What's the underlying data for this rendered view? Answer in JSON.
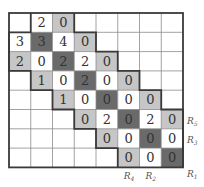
{
  "figure": {
    "rows": 8,
    "cols": 8,
    "colors": {
      "white": "#ffffff",
      "light": "#c6c6c6",
      "dark": "#6a6a6a",
      "grid_line": "#8a8a8a",
      "thick_line": "#3a3a3a",
      "text": "#333333"
    },
    "cells": [
      {
        "r": 0,
        "c": 1,
        "v": "2",
        "shade": "white"
      },
      {
        "r": 0,
        "c": 2,
        "v": "0",
        "shade": "light"
      },
      {
        "r": 1,
        "c": 0,
        "v": "3",
        "shade": "white"
      },
      {
        "r": 1,
        "c": 1,
        "v": "3",
        "shade": "dark"
      },
      {
        "r": 1,
        "c": 2,
        "v": "4",
        "shade": "white"
      },
      {
        "r": 1,
        "c": 3,
        "v": "0",
        "shade": "light"
      },
      {
        "r": 2,
        "c": 0,
        "v": "2",
        "shade": "light"
      },
      {
        "r": 2,
        "c": 1,
        "v": "0",
        "shade": "white"
      },
      {
        "r": 2,
        "c": 2,
        "v": "2",
        "shade": "dark"
      },
      {
        "r": 2,
        "c": 3,
        "v": "2",
        "shade": "white"
      },
      {
        "r": 2,
        "c": 4,
        "v": "0",
        "shade": "light"
      },
      {
        "r": 3,
        "c": 1,
        "v": "1",
        "shade": "light"
      },
      {
        "r": 3,
        "c": 2,
        "v": "0",
        "shade": "white"
      },
      {
        "r": 3,
        "c": 3,
        "v": "2",
        "shade": "dark"
      },
      {
        "r": 3,
        "c": 4,
        "v": "0",
        "shade": "white"
      },
      {
        "r": 3,
        "c": 5,
        "v": "0",
        "shade": "light"
      },
      {
        "r": 4,
        "c": 2,
        "v": "1",
        "shade": "light"
      },
      {
        "r": 4,
        "c": 3,
        "v": "0",
        "shade": "white"
      },
      {
        "r": 4,
        "c": 4,
        "v": "0",
        "shade": "dark"
      },
      {
        "r": 4,
        "c": 5,
        "v": "0",
        "shade": "white"
      },
      {
        "r": 4,
        "c": 6,
        "v": "0",
        "shade": "light"
      },
      {
        "r": 5,
        "c": 3,
        "v": "0",
        "shade": "light"
      },
      {
        "r": 5,
        "c": 4,
        "v": "2",
        "shade": "white"
      },
      {
        "r": 5,
        "c": 5,
        "v": "0",
        "shade": "dark"
      },
      {
        "r": 5,
        "c": 6,
        "v": "2",
        "shade": "white"
      },
      {
        "r": 5,
        "c": 7,
        "v": "0",
        "shade": "light"
      },
      {
        "r": 6,
        "c": 4,
        "v": "0",
        "shade": "light"
      },
      {
        "r": 6,
        "c": 5,
        "v": "0",
        "shade": "white"
      },
      {
        "r": 6,
        "c": 6,
        "v": "0",
        "shade": "dark"
      },
      {
        "r": 6,
        "c": 7,
        "v": "0",
        "shade": "white"
      },
      {
        "r": 7,
        "c": 5,
        "v": "0",
        "shade": "light"
      },
      {
        "r": 7,
        "c": 6,
        "v": "0",
        "shade": "white"
      },
      {
        "r": 7,
        "c": 7,
        "v": "0",
        "shade": "dark"
      }
    ],
    "right_labels": [
      {
        "row": 5,
        "base": "R",
        "sub": "5"
      },
      {
        "row": 6,
        "base": "R",
        "sub": "3"
      },
      {
        "row": 7,
        "base": "R",
        "sub": "1",
        "offset": "below"
      }
    ],
    "bottom_labels": [
      {
        "col": 5,
        "base": "R",
        "sub": "4"
      },
      {
        "col": 6,
        "base": "R",
        "sub": "2"
      }
    ]
  }
}
